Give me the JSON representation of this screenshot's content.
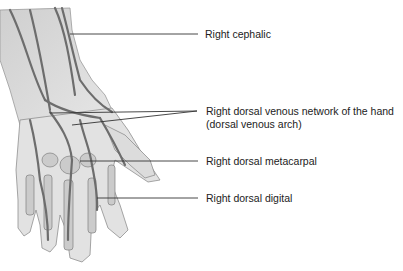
{
  "figure": {
    "labels": [
      {
        "id": "cephalic",
        "text": "Right cephalic",
        "x": 205,
        "y": 28
      },
      {
        "id": "venous_network",
        "text": "Right dorsal venous network of the hand",
        "text2": "(dorsal venous arch)",
        "x": 206,
        "y": 105
      },
      {
        "id": "metacarpal",
        "text": "Right dorsal metacarpal",
        "x": 206,
        "y": 155
      },
      {
        "id": "digital",
        "text": "Right dorsal digital",
        "x": 206,
        "y": 192
      }
    ],
    "colors": {
      "vein": "#6d6d6d",
      "skin": "#d9d9d9",
      "bone": "#c4c4c4",
      "leader": "#333333",
      "text": "#222222"
    }
  }
}
